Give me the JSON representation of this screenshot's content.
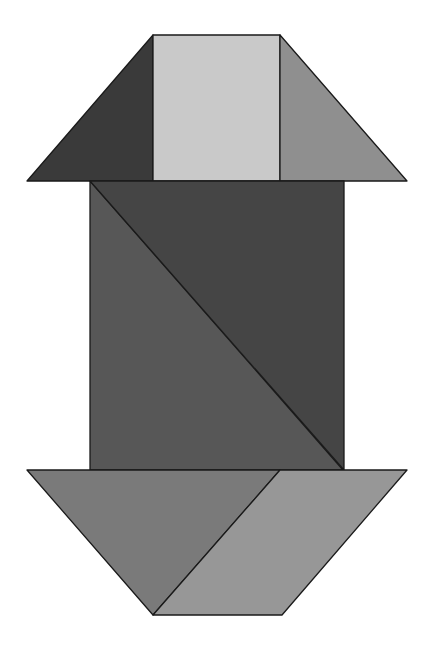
{
  "figure": {
    "title": "",
    "background": "#ffffff",
    "pieces": [
      {
        "name": "top-left-triangle",
        "shape": "triangle",
        "color": "#3a3a3a",
        "points": "153,35 153,181 27,181"
      },
      {
        "name": "top-square",
        "shape": "square",
        "color": "#c9c9c9",
        "points": "153,35 280,35 280,181 153,181"
      },
      {
        "name": "top-right-triangle",
        "shape": "triangle",
        "color": "#8f8f8f",
        "points": "280,35 407,181 280,181"
      },
      {
        "name": "middle-left-large-triangle",
        "shape": "triangle",
        "color": "#575757",
        "points": "90,181 90,470 343,470"
      },
      {
        "name": "middle-right-large-triangle",
        "shape": "triangle",
        "color": "#454545",
        "points": "90,181 344,181 344,470"
      },
      {
        "name": "bottom-left-triangle",
        "shape": "triangle",
        "color": "#7a7a7a",
        "points": "27,470 280,470 153,615"
      },
      {
        "name": "bottom-parallelogram",
        "shape": "parallelogram",
        "color": "#979797",
        "points": "280,470 407,470 282,615 153,615"
      }
    ]
  }
}
